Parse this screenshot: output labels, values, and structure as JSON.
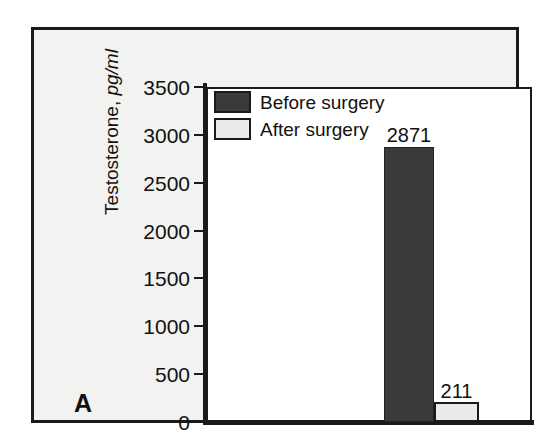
{
  "figure": {
    "panel_label": "A",
    "background_color": "#f2f2f0",
    "frame_color": "#1a1a1a",
    "plot_background": "#ffffff"
  },
  "chart_data": {
    "type": "bar",
    "title": "",
    "xlabel": "",
    "ylabel": "Testosterone, pg/ml",
    "ylabel_main": "Testosterone, ",
    "ylabel_units": "pg/ml",
    "ylim": [
      0,
      3500
    ],
    "ytick_values": [
      0,
      500,
      1000,
      1500,
      2000,
      2500,
      3000,
      3500
    ],
    "ytick_labels": [
      "0",
      "500",
      "1000",
      "1500",
      "2000",
      "2500",
      "3000",
      "3500"
    ],
    "grid": false,
    "legend_position": "top-left",
    "categories": [
      ""
    ],
    "series": [
      {
        "name": "Before surgery",
        "values": [
          2871
        ],
        "value_labels": [
          "2871"
        ],
        "color": "#3a3a3a"
      },
      {
        "name": "After surgery",
        "values": [
          211
        ],
        "value_labels": [
          "211"
        ],
        "color": "#ebebeb"
      }
    ],
    "annotations": [
      {
        "text": "2871",
        "series": "Before surgery"
      },
      {
        "text": "211",
        "series": "After surgery"
      }
    ]
  },
  "legend": {
    "items": [
      {
        "label": "Before surgery",
        "swatch": "dark"
      },
      {
        "label": "After surgery",
        "swatch": "light"
      }
    ]
  }
}
